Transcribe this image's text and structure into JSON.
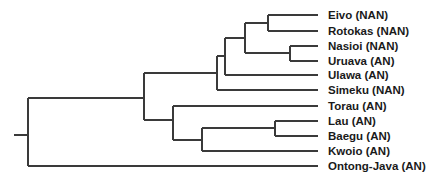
{
  "tree": {
    "leaves": [
      {
        "label": "Eivo (NAN)",
        "y": 15
      },
      {
        "label": "Rotokas (NAN)",
        "y": 31
      },
      {
        "label": "Nasioi (NAN)",
        "y": 46
      },
      {
        "label": "Uruava (AN)",
        "y": 61
      },
      {
        "label": "Ulawa (AN)",
        "y": 75
      },
      {
        "label": "Simeku (NAN)",
        "y": 90
      },
      {
        "label": "Torau (AN)",
        "y": 106
      },
      {
        "label": "Lau (AN)",
        "y": 121
      },
      {
        "label": "Baegu (AN)",
        "y": 136
      },
      {
        "label": "Kwoio (AN)",
        "y": 151
      },
      {
        "label": "Ontong-Java (AN)",
        "y": 166
      }
    ],
    "colors": {
      "line": "#3a3a3a",
      "text": "#1a1a1a",
      "background": "#ffffff"
    }
  }
}
